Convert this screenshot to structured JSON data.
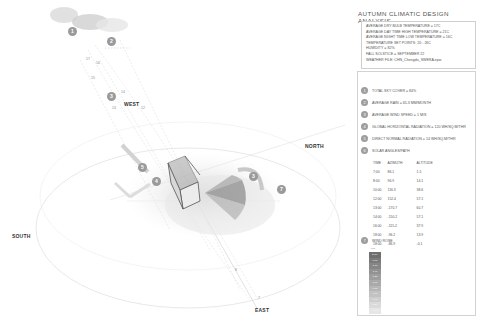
{
  "title": "AUTUMN CLIMATIC DESIGN ANALYSIS",
  "climate_summary": [
    "AVERAGE DRY BULB TEMPERATURE = 17C",
    "AVERAGE DAY TIME HIGH TEMPERATURE = 21C",
    "AVERAGE NIGHT TIME LOW TEMPERATURE = 16C",
    "TEMPERATURE SET POINTS: 20 - 26C",
    "HUMIDITY = 82%",
    "FALL SOLSTICE = SEPTEMBER 22",
    "WEATHER FILE: CHN_Chengdu_SWERA.epw"
  ],
  "legend": [
    {
      "num": "1",
      "label": "TOTAL SKY COVER = 84%"
    },
    {
      "num": "2",
      "label": "AVERAGE RAIN = 65.3 MM/MONTH"
    },
    {
      "num": "3",
      "label": "AVERAGE WIND SPEED = 1 M/S"
    },
    {
      "num": "4",
      "label": "GLOBAL HORIZONTAL RADIATION = 120 WH/SQ.M/THR"
    },
    {
      "num": "5",
      "label": "DIRECT NORMAL RADIATION = 14 WH/SQ.M/THR"
    },
    {
      "num": "6",
      "label": "SOLAR ANGLES/PATH"
    },
    {
      "num": "7",
      "label": "WIND ROSE"
    }
  ],
  "sun_table": {
    "headers": [
      "TIME",
      "AZIMUTH",
      "ALTITUDE"
    ],
    "rows": [
      [
        "7:00",
        "86.1",
        "1.5"
      ],
      [
        "8:00",
        "96.9",
        "14.1"
      ],
      [
        "10:00",
        "116.3",
        "38.6"
      ],
      [
        "12:00",
        "152.4",
        "57.1"
      ],
      [
        "13:00",
        "-170.7",
        "60.7"
      ],
      [
        "14:00",
        "-150.2",
        "57.1"
      ],
      [
        "16:00",
        "-115.2",
        "37.9"
      ],
      [
        "18:00",
        "-96.2",
        "13.9"
      ],
      [
        "18:00",
        "-86.9",
        "-0.1"
      ]
    ]
  },
  "wind_scale": {
    "unit": "m/s",
    "steps": [
      "2.00<",
      "1.80",
      "1.60",
      "1.40",
      "1.20",
      "1.00",
      "0.80",
      "0.60",
      "0.40",
      "0.20",
      "<0.00"
    ]
  },
  "compass": {
    "north": "NORTH",
    "south": "SOUTH",
    "east": "EAST",
    "west": "WEST"
  },
  "diagram_markers": [
    {
      "num": "1",
      "x": 72,
      "y": 31
    },
    {
      "num": "2",
      "x": 111,
      "y": 41
    },
    {
      "num": "3",
      "x": 111,
      "y": 96
    },
    {
      "num": "5",
      "x": 142,
      "y": 167
    },
    {
      "num": "4",
      "x": 156,
      "y": 181
    },
    {
      "num": "3",
      "x": 253,
      "y": 176
    },
    {
      "num": "7",
      "x": 281,
      "y": 189
    }
  ],
  "hour_ticks": [
    {
      "t": "17",
      "x": 86,
      "y": 57
    },
    {
      "t": "16",
      "x": 96,
      "y": 61
    },
    {
      "t": "15",
      "x": 91,
      "y": 76
    },
    {
      "t": "14",
      "x": 121,
      "y": 90
    },
    {
      "t": "13",
      "x": 112,
      "y": 106
    },
    {
      "t": "12",
      "x": 141,
      "y": 106
    },
    {
      "t": "8",
      "x": 235,
      "y": 268
    },
    {
      "t": "7",
      "x": 258,
      "y": 296
    }
  ],
  "colors": {
    "marker": "#9a9a9a",
    "grid": "#dddddd",
    "text": "#555555"
  }
}
